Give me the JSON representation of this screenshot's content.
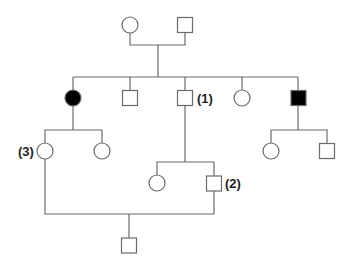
{
  "diagram": {
    "type": "pedigree",
    "colors": {
      "affected": "#000000",
      "unaffected": "#ffffff",
      "line": "#6b6b6b"
    },
    "individuals": [
      {
        "id": "I-1",
        "generation": 1,
        "sex": "female",
        "affected": false,
        "label": ""
      },
      {
        "id": "I-2",
        "generation": 1,
        "sex": "male",
        "affected": false,
        "label": ""
      },
      {
        "id": "II-1",
        "generation": 2,
        "sex": "female",
        "affected": true,
        "label": ""
      },
      {
        "id": "II-2",
        "generation": 2,
        "sex": "male",
        "affected": false,
        "label": ""
      },
      {
        "id": "II-3",
        "generation": 2,
        "sex": "male",
        "affected": false,
        "label": "(1)"
      },
      {
        "id": "II-4",
        "generation": 2,
        "sex": "female",
        "affected": false,
        "label": ""
      },
      {
        "id": "II-5",
        "generation": 2,
        "sex": "male",
        "affected": true,
        "label": ""
      },
      {
        "id": "III-1",
        "generation": 3,
        "sex": "female",
        "affected": false,
        "label": "(3)"
      },
      {
        "id": "III-2",
        "generation": 3,
        "sex": "female",
        "affected": false,
        "label": ""
      },
      {
        "id": "III-3",
        "generation": 3,
        "sex": "female",
        "affected": false,
        "label": ""
      },
      {
        "id": "III-4",
        "generation": 3,
        "sex": "male",
        "affected": false,
        "label": "(2)"
      },
      {
        "id": "III-5",
        "generation": 3,
        "sex": "female",
        "affected": false,
        "label": ""
      },
      {
        "id": "III-6",
        "generation": 3,
        "sex": "male",
        "affected": false,
        "label": ""
      },
      {
        "id": "IV-1",
        "generation": 4,
        "sex": "male",
        "affected": false,
        "label": ""
      }
    ],
    "matings": [
      {
        "parents": [
          "I-1",
          "I-2"
        ],
        "children": [
          "II-1",
          "II-2",
          "II-3",
          "II-4",
          "II-5"
        ]
      },
      {
        "parents": [
          "II-1"
        ],
        "children": [
          "III-1",
          "III-2"
        ]
      },
      {
        "parents": [
          "II-3"
        ],
        "children": [
          "III-3",
          "III-4"
        ]
      },
      {
        "parents": [
          "II-5"
        ],
        "children": [
          "III-5",
          "III-6"
        ]
      },
      {
        "parents": [
          "III-1",
          "III-4"
        ],
        "children": [
          "IV-1"
        ]
      }
    ],
    "labels": {
      "one": "(1)",
      "two": "(2)",
      "three": "(3)"
    }
  }
}
